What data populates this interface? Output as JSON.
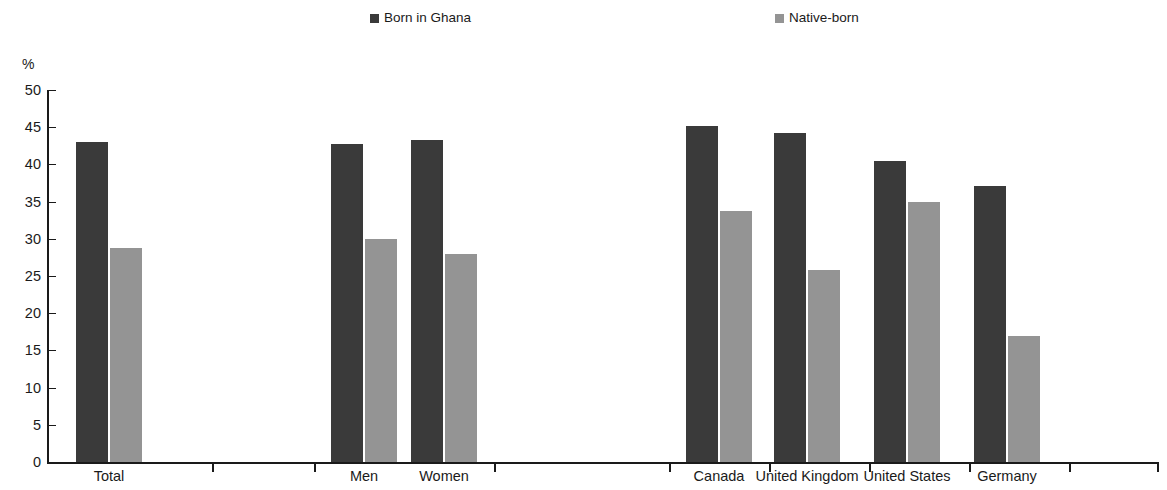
{
  "chart_data": {
    "type": "bar",
    "title": "",
    "subtitle": "",
    "xlabel": "",
    "ylabel": "%",
    "ylim": [
      0,
      50
    ],
    "ytick_step": 5,
    "yticks": [
      0,
      5,
      10,
      15,
      20,
      25,
      30,
      35,
      40,
      45,
      50
    ],
    "ytick_labels": [
      "0",
      "5",
      "10",
      "15",
      "20",
      "25",
      "30",
      "35",
      "40",
      "45",
      "50"
    ],
    "grid": false,
    "legend_position": "top",
    "categories": [
      "Total",
      "Men",
      "Women",
      "Canada",
      "United Kingdom",
      "United States",
      "Germany"
    ],
    "series": [
      {
        "name": "Born in Ghana",
        "color": "#3a3a3a",
        "values": [
          43.0,
          42.7,
          43.3,
          45.1,
          44.2,
          40.4,
          37.1
        ]
      },
      {
        "name": "Native-born",
        "color": "#949494",
        "values": [
          28.8,
          30.0,
          27.9,
          33.7,
          25.8,
          34.9,
          16.9
        ]
      }
    ],
    "group_breaks_after": [
      "Total",
      "Women"
    ]
  },
  "legend": {
    "items": [
      {
        "label": "Born in Ghana",
        "color": "#3a3a3a"
      },
      {
        "label": "Native-born",
        "color": "#949494"
      }
    ]
  },
  "axis": {
    "unit_label": "%"
  }
}
